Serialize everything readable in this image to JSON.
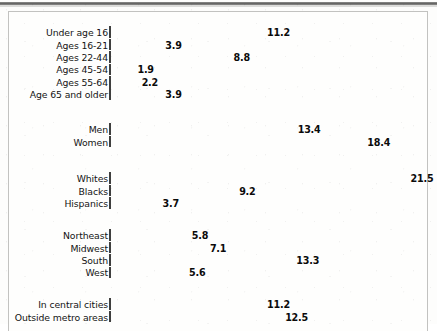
{
  "chart_data": {
    "type": "bar",
    "orientation": "horizontal",
    "title": "",
    "subtitle": "",
    "xlabel": "",
    "ylabel": "",
    "xlim": [
      0,
      22
    ],
    "grid": false,
    "legend": null,
    "value_labels": true,
    "categories": [
      "Under age 16",
      "Ages 16-21",
      "Ages 22-44",
      "Ages 45-54",
      "Ages 55-64",
      "Age 65 and older",
      "Men",
      "Women",
      "Whites",
      "Blacks",
      "Hispanics",
      "Northeast",
      "Midwest",
      "South",
      "West",
      "In central cities",
      "Outside metro areas"
    ],
    "values": [
      11.2,
      3.9,
      8.8,
      1.9,
      2.2,
      3.9,
      13.4,
      18.4,
      21.5,
      9.2,
      3.7,
      5.8,
      7.1,
      13.3,
      5.6,
      11.2,
      12.5
    ],
    "groups": [
      {
        "name": "age",
        "top": 14,
        "bars": [
          {
            "label": "Under age 16",
            "value": 11.2,
            "text": "11.2"
          },
          {
            "label": "Ages 16-21",
            "value": 3.9,
            "text": "3.9"
          },
          {
            "label": "Ages 22-44",
            "value": 8.8,
            "text": "8.8"
          },
          {
            "label": "Ages 45-54",
            "value": 1.9,
            "text": "1.9"
          },
          {
            "label": "Ages 55-64",
            "value": 2.2,
            "text": "2.2"
          },
          {
            "label": "Age 65 and older",
            "value": 3.9,
            "text": "3.9"
          }
        ]
      },
      {
        "name": "sex",
        "top": 111,
        "bars": [
          {
            "label": "Men",
            "value": 13.4,
            "text": "13.4"
          },
          {
            "label": "Women",
            "value": 18.4,
            "text": "18.4"
          }
        ]
      },
      {
        "name": "race-ethnicity",
        "top": 160,
        "bars": [
          {
            "label": "Whites",
            "value": 21.5,
            "text": "21.5"
          },
          {
            "label": "Blacks",
            "value": 9.2,
            "text": "9.2"
          },
          {
            "label": "Hispanics",
            "value": 3.7,
            "text": "3.7"
          }
        ]
      },
      {
        "name": "region",
        "top": 217,
        "bars": [
          {
            "label": "Northeast",
            "value": 5.8,
            "text": "5.8"
          },
          {
            "label": "Midwest",
            "value": 7.1,
            "text": "7.1"
          },
          {
            "label": "South",
            "value": 13.3,
            "text": "13.3"
          },
          {
            "label": "West",
            "value": 5.6,
            "text": "5.6"
          }
        ]
      },
      {
        "name": "metro-location",
        "top": 286,
        "bars": [
          {
            "label": "In central cities",
            "value": 11.2,
            "text": "11.2"
          },
          {
            "label": "Outside metro areas",
            "value": 12.5,
            "text": "12.5"
          }
        ]
      }
    ]
  },
  "style": {
    "bar_fill": "#8d8d8c",
    "bar_border": "#3f3f3e",
    "panel_border": "#c2c2c0",
    "page_background": "#fdfdfc",
    "label_color": "#141414",
    "value_color": "#0b0b0b",
    "px_per_unit": 13.93,
    "bar_origin_x": 100
  }
}
